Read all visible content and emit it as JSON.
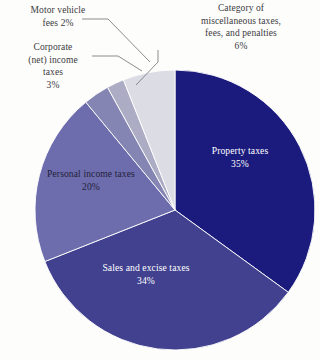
{
  "chart_data": {
    "type": "pie",
    "title": "",
    "subtitle": "",
    "xlabel": "",
    "ylabel": "",
    "grid": false,
    "legend_position": "none",
    "units": "percent",
    "start_angle_deg": 0,
    "direction": "clockwise",
    "categories": [
      "Property taxes",
      "Sales and excise taxes",
      "Personal income taxes",
      "Corporate (net) income taxes",
      "Motor vehicle fees",
      "Category of miscellaneous taxes, fees, and penalties"
    ],
    "values": [
      35,
      34,
      20,
      3,
      2,
      6
    ],
    "slices": [
      {
        "id": "property",
        "name": "Property taxes",
        "value": 35,
        "value_text": "35%",
        "color": "#1b1b7e",
        "label_placement": "inside",
        "label_color": "#ffffff",
        "label_lines": "Property taxes\n35%"
      },
      {
        "id": "sales",
        "name": "Sales and excise taxes",
        "value": 34,
        "value_text": "34%",
        "color": "#41418f",
        "label_placement": "inside",
        "label_color": "#ffffff",
        "label_lines": "Sales and excise taxes\n34%"
      },
      {
        "id": "personal",
        "name": "Personal income taxes",
        "value": 20,
        "value_text": "20%",
        "color": "#6d6dae",
        "label_placement": "inside",
        "label_color": "#241f38",
        "label_lines": "Personal income taxes\n20%"
      },
      {
        "id": "corporate",
        "name": "Corporate (net) income taxes",
        "value": 3,
        "value_text": "3%",
        "color": "#8585b4",
        "label_placement": "callout-left",
        "label_color": "#3b3b41",
        "label_lines": "Corporate\n(net) income\ntaxes\n3%"
      },
      {
        "id": "motor-vehicle",
        "name": "Motor vehicle fees",
        "value": 2,
        "value_text": "2%",
        "color": "#acacc4",
        "label_placement": "callout-left",
        "label_color": "#3b3b41",
        "label_lines": "Motor vehicle\nfees 2%"
      },
      {
        "id": "miscellaneous",
        "name": "Category of miscellaneous taxes, fees, and penalties",
        "value": 6,
        "value_text": "6%",
        "color": "#dcdce4",
        "label_placement": "callout-top",
        "label_color": "#3b3b41",
        "label_lines": "Category of\nmiscellaneous taxes,\nfees, and penalties\n6%"
      }
    ]
  },
  "labels": {
    "motor_vehicle": "Motor vehicle\nfees 2%",
    "corporate": "Corporate\n(net) income\ntaxes\n3%",
    "miscellaneous": "Category of\nmiscellaneous taxes,\nfees, and penalties\n6%",
    "property": "Property taxes\n35%",
    "sales": "Sales and excise taxes\n34%",
    "personal": "Personal income taxes\n20%"
  },
  "colors": {
    "background": "#fdfdfb",
    "leader_line": "#6f6f76",
    "slice_border": "#ffffff",
    "text_dark": "#3b3b41",
    "text_light": "#ffffff"
  }
}
